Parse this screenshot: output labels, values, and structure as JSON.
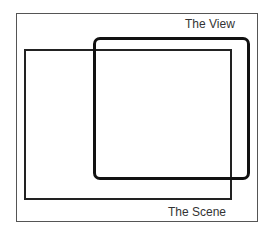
{
  "diagram": {
    "labels": {
      "view": "The View",
      "scene": "The Scene"
    },
    "shapes": [
      {
        "name": "outer-frame",
        "style": "thin rectangle"
      },
      {
        "name": "scene",
        "style": "medium rectangle"
      },
      {
        "name": "view",
        "style": "thick rounded rectangle"
      }
    ]
  }
}
